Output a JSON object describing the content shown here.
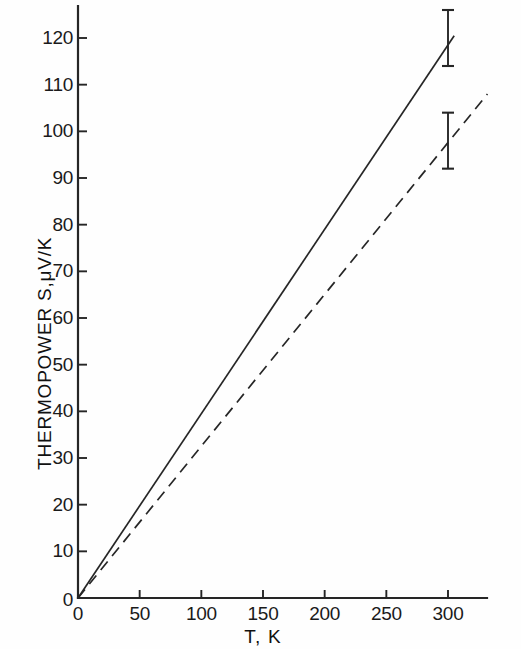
{
  "chart_data": {
    "type": "line",
    "title": "",
    "xlabel": "T, K",
    "ylabel": "THERMOPOWER S,μV/K",
    "xlim": [
      0,
      340
    ],
    "ylim": [
      0,
      126
    ],
    "grid": false,
    "legend": "none",
    "xticks": [
      0,
      50,
      100,
      150,
      200,
      250,
      300
    ],
    "xtick_labels": [
      "0",
      "50",
      "100",
      "150",
      "200",
      "250",
      "300"
    ],
    "yticks": [
      0,
      10,
      20,
      30,
      40,
      50,
      60,
      70,
      80,
      90,
      100,
      110,
      120
    ],
    "ytick_labels": [
      "0",
      "10",
      "20",
      "30",
      "40",
      "50",
      "60",
      "70",
      "80",
      "90",
      "100",
      "110",
      "120"
    ],
    "series": [
      {
        "name": "solid-line",
        "style": "solid",
        "x": [
          0,
          305
        ],
        "values": [
          0,
          120.5
        ],
        "slope": 0.395,
        "error_bars": [
          {
            "x": 300,
            "y": 118.5,
            "yerr_low": 114.0,
            "yerr_high": 126.0
          }
        ]
      },
      {
        "name": "dashed-line",
        "style": "dashed",
        "x": [
          0,
          332
        ],
        "values": [
          0,
          108.0
        ],
        "slope": 0.325,
        "error_bars": [
          {
            "x": 300,
            "y": 98.0,
            "yerr_low": 92.0,
            "yerr_high": 104.0
          }
        ]
      }
    ]
  },
  "axes": {
    "x_title": "T, K",
    "y_title": "THERMOPOWER S,μV/K"
  },
  "style": {
    "ink_color": "#262626",
    "background": "#fefefe",
    "text_color": "#1a1a1a"
  }
}
